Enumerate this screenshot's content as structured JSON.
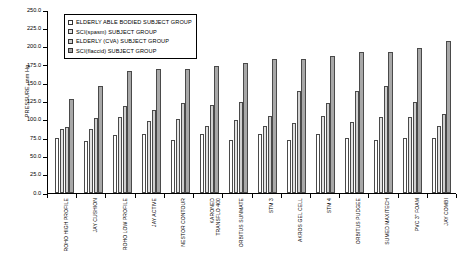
{
  "chart_data": {
    "type": "bar",
    "title": "",
    "xlabel": "",
    "ylabel": "PRESSURE, mm Hg",
    "ylim": [
      0,
      250
    ],
    "ytick_step": 25,
    "ytick_labels": [
      "0.0",
      "25.0",
      "50.0",
      "75.0",
      "100.0",
      "125.0",
      "150.0",
      "175.0",
      "200.0",
      "225.0",
      "250.0"
    ],
    "grid": false,
    "legend_position": "top-left-inside",
    "categories": [
      "ROHO HIGH PROFILE",
      "JAY CUSHION",
      "ROHO LOW PROFILE",
      "JAY ACTIVE",
      "NESTOR CONTOUR",
      "KARONED\nTRANSFLO 400",
      "ORBITUS SUNMATE",
      "STM 3",
      "AKROS GEL CELL",
      "STM 4",
      "ORBITUS PUDGEE",
      "SUMED MAXITECH",
      "PVC 3\" FOAM",
      "JAY COMBI"
    ],
    "series": [
      {
        "name": "ELDERLY ABLE BODIED SUBJECT GROUP",
        "color": "#ffffff",
        "values": [
          75,
          71,
          79,
          80,
          73,
          80,
          72,
          80,
          73,
          80,
          75,
          73,
          75,
          75
        ]
      },
      {
        "name": "SCI(spasm) SUBJECT GROUP",
        "color": "#e2e2e2",
        "values": [
          88,
          88,
          104,
          98,
          101,
          91,
          100,
          92,
          96,
          105,
          97,
          104,
          104,
          92
        ]
      },
      {
        "name": "ELDERLY (CVA) SUBJECT GROUP",
        "color": "#d0d0d0",
        "values": [
          90,
          103,
          119,
          114,
          123,
          120,
          125,
          105,
          140,
          123,
          140,
          146,
          125,
          108
        ]
      },
      {
        "name": "SCI(flaccid) SUBJECT GROUP",
        "color": "#a8a8a8",
        "values": [
          128,
          146,
          167,
          170,
          170,
          174,
          177,
          183,
          183,
          187,
          193,
          193,
          198,
          208
        ]
      }
    ]
  }
}
